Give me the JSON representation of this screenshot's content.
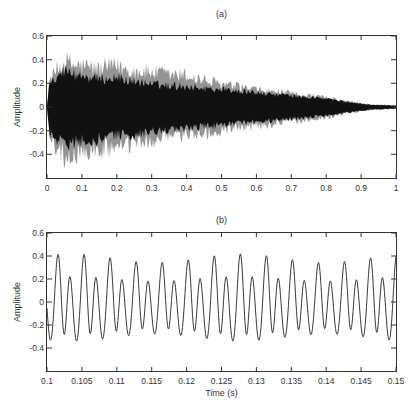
{
  "figure": {
    "background": "#ffffff",
    "axis_color": "#333333",
    "text_color": "#333333"
  },
  "chart_data": [
    {
      "id": "a",
      "type": "area",
      "title": "(a)",
      "xlabel": "",
      "ylabel": "Amplitude",
      "xlim": [
        0,
        1
      ],
      "ylim": [
        -0.6,
        0.6
      ],
      "grid": false,
      "xtick_values": [
        0,
        0.1,
        0.2,
        0.3,
        0.4,
        0.5,
        0.6,
        0.7,
        0.8,
        0.9,
        1
      ],
      "xtick_labels": [
        "0",
        "0.1",
        "0.2",
        "0.3",
        "0.4",
        "0.5",
        "0.6",
        "0.7",
        "0.8",
        "0.9",
        "1"
      ],
      "ytick_values": [
        0.6,
        0.4,
        0.2,
        0,
        -0.2,
        -0.4
      ],
      "ytick_labels": [
        "0.6",
        "0.4",
        "0.2",
        "0",
        "-0.2",
        "-0.4"
      ],
      "jitter_seed": 12345,
      "series": [
        {
          "name": "signal-outer",
          "color": "#949494",
          "envelope_t": [
            0.0,
            0.008,
            0.03,
            0.055,
            0.08,
            0.11,
            0.15,
            0.18,
            0.21,
            0.25,
            0.3,
            0.35,
            0.4,
            0.45,
            0.5,
            0.55,
            0.6,
            0.65,
            0.7,
            0.75,
            0.8,
            0.85,
            0.9,
            0.93,
            1.0
          ],
          "envelope_upper": [
            0.01,
            0.3,
            0.4,
            0.48,
            0.44,
            0.43,
            0.4,
            0.43,
            0.42,
            0.38,
            0.37,
            0.34,
            0.33,
            0.28,
            0.24,
            0.21,
            0.18,
            0.16,
            0.14,
            0.12,
            0.1,
            0.065,
            0.04,
            0.025,
            0.018
          ],
          "envelope_lower": [
            -0.01,
            -0.3,
            -0.44,
            -0.56,
            -0.5,
            -0.46,
            -0.47,
            -0.44,
            -0.42,
            -0.4,
            -0.36,
            -0.32,
            -0.3,
            -0.28,
            -0.27,
            -0.23,
            -0.21,
            -0.18,
            -0.15,
            -0.13,
            -0.11,
            -0.07,
            -0.045,
            -0.03,
            -0.018
          ]
        },
        {
          "name": "signal-inner",
          "color": "#111111",
          "envelope_t": [
            0.0,
            0.008,
            0.03,
            0.055,
            0.08,
            0.11,
            0.15,
            0.2,
            0.25,
            0.3,
            0.35,
            0.4,
            0.45,
            0.5,
            0.55,
            0.6,
            0.65,
            0.7,
            0.75,
            0.8,
            0.85,
            0.9,
            0.93,
            1.0
          ],
          "envelope_upper": [
            0.01,
            0.27,
            0.33,
            0.37,
            0.33,
            0.31,
            0.28,
            0.3,
            0.26,
            0.23,
            0.22,
            0.21,
            0.19,
            0.18,
            0.16,
            0.145,
            0.13,
            0.115,
            0.1,
            0.085,
            0.055,
            0.035,
            0.022,
            0.015
          ],
          "envelope_lower": [
            -0.01,
            -0.27,
            -0.33,
            -0.38,
            -0.36,
            -0.34,
            -0.32,
            -0.29,
            -0.28,
            -0.26,
            -0.24,
            -0.22,
            -0.2,
            -0.185,
            -0.17,
            -0.155,
            -0.135,
            -0.12,
            -0.105,
            -0.09,
            -0.06,
            -0.04,
            -0.025,
            -0.015
          ]
        }
      ]
    },
    {
      "id": "b",
      "type": "line",
      "title": "(b)",
      "xlabel": "Time (s)",
      "ylabel": "Amplitude",
      "xlim": [
        0.1,
        0.15
      ],
      "ylim": [
        -0.6,
        0.6
      ],
      "grid": false,
      "xtick_values": [
        0.1,
        0.105,
        0.11,
        0.115,
        0.12,
        0.125,
        0.13,
        0.135,
        0.14,
        0.145,
        0.15
      ],
      "xtick_labels": [
        "0.1",
        "0.105",
        "0.11",
        "0.115",
        "0.12",
        "0.125",
        "0.13",
        "0.135",
        "0.14",
        "0.145",
        "0.15"
      ],
      "ytick_values": [
        0.6,
        0.4,
        0.2,
        0,
        -0.2,
        -0.4
      ],
      "ytick_labels": [
        "0.6",
        "0.4",
        "0.2",
        "0",
        "-0.2",
        "-0.4"
      ],
      "line_color": "#3a3a3a",
      "synthesis": {
        "f0_hz": 268,
        "t_ref": 0.1015,
        "harmonics": [
          {
            "n": 1,
            "a_cos": 0.09,
            "a_sin": 0.06
          },
          {
            "n": 2,
            "a_cos": 0.28,
            "a_sin": 0.0
          },
          {
            "n": 3,
            "a_cos": 0.0,
            "a_sin": 0.035
          }
        ],
        "am_rate_hz": 41,
        "am_depth": 0.1,
        "am_phase": 0.7
      }
    }
  ]
}
